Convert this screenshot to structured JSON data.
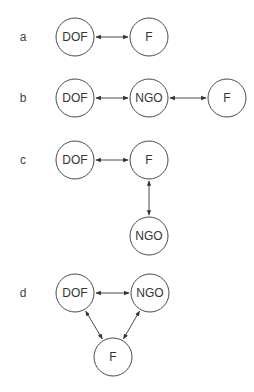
{
  "panels": [
    {
      "label": "a",
      "label_pos": [
        23,
        37
      ],
      "nodes": [
        {
          "id": "a-dof",
          "text": "DOF",
          "cx": 75,
          "cy": 37
        },
        {
          "id": "a-f",
          "text": "F",
          "cx": 149,
          "cy": 37
        }
      ],
      "edges": [
        {
          "from": "a-dof",
          "to": "a-f",
          "bidirectional": true
        }
      ]
    },
    {
      "label": "b",
      "label_pos": [
        23,
        98
      ],
      "nodes": [
        {
          "id": "b-dof",
          "text": "DOF",
          "cx": 75,
          "cy": 98
        },
        {
          "id": "b-ngo",
          "text": "NGO",
          "cx": 149,
          "cy": 98
        },
        {
          "id": "b-f",
          "text": "F",
          "cx": 227,
          "cy": 98
        }
      ],
      "edges": [
        {
          "from": "b-dof",
          "to": "b-ngo",
          "bidirectional": true
        },
        {
          "from": "b-ngo",
          "to": "b-f",
          "bidirectional": true
        }
      ]
    },
    {
      "label": "c",
      "label_pos": [
        23,
        160
      ],
      "nodes": [
        {
          "id": "c-dof",
          "text": "DOF",
          "cx": 75,
          "cy": 160
        },
        {
          "id": "c-f",
          "text": "F",
          "cx": 149,
          "cy": 160
        },
        {
          "id": "c-ngo",
          "text": "NGO",
          "cx": 149,
          "cy": 236
        }
      ],
      "edges": [
        {
          "from": "c-dof",
          "to": "c-f",
          "bidirectional": true
        },
        {
          "from": "c-f",
          "to": "c-ngo",
          "bidirectional": true
        }
      ]
    },
    {
      "label": "d",
      "label_pos": [
        23,
        293
      ],
      "nodes": [
        {
          "id": "d-dof",
          "text": "DOF",
          "cx": 75,
          "cy": 293
        },
        {
          "id": "d-ngo",
          "text": "NGO",
          "cx": 150,
          "cy": 293
        },
        {
          "id": "d-f",
          "text": "F",
          "cx": 113,
          "cy": 357
        }
      ],
      "edges": [
        {
          "from": "d-dof",
          "to": "d-ngo",
          "bidirectional": true
        },
        {
          "from": "d-dof",
          "to": "d-f",
          "bidirectional": true
        },
        {
          "from": "d-ngo",
          "to": "d-f",
          "bidirectional": true
        }
      ]
    }
  ],
  "style": {
    "node_radius": 19,
    "stroke_color": "#4a4a4a",
    "text_color": "#333333",
    "background": "#ffffff"
  }
}
